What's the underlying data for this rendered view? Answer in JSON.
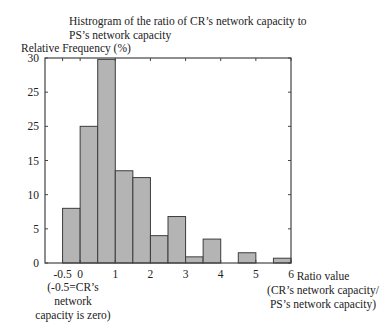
{
  "chart_data": {
    "type": "bar",
    "title": "Histrogram of the ratio of CR’s network capacity to PS’s network capacity",
    "title_lines": [
      "Histrogram of the ratio of CR’s network capacity to",
      "PS’s network capacity"
    ],
    "ylabel": "Relative Frequency (%)",
    "xlabel": "Ratio value (CR’s network capacity/ PS’s network capacity)",
    "xlabel_lines": [
      "Ratio value",
      "(CR’s network capacity/",
      "PS’s network capacity)"
    ],
    "annotation_lines": [
      "(-0.5=CR’s network",
      "capacity is zero)"
    ],
    "xlim": [
      -1,
      6
    ],
    "ylim": [
      0,
      30
    ],
    "xticks": [
      -0.5,
      0,
      1,
      2,
      3,
      4,
      5,
      6
    ],
    "xtick_labels": [
      "-0.5",
      "0",
      "1",
      "2",
      "3",
      "4",
      "5",
      "6"
    ],
    "yticks": [
      0,
      5,
      10,
      15,
      20,
      25,
      30
    ],
    "ytick_labels": [
      "0",
      "5",
      "10",
      "15",
      "25",
      "25",
      "30"
    ],
    "grid": false,
    "bin_width": 0.5,
    "bins": [
      {
        "start": -0.5,
        "end": 0.0,
        "value": 8.0
      },
      {
        "start": 0.0,
        "end": 0.5,
        "value": 20.0
      },
      {
        "start": 0.5,
        "end": 1.0,
        "value": 29.8
      },
      {
        "start": 1.0,
        "end": 1.5,
        "value": 13.5
      },
      {
        "start": 1.5,
        "end": 2.0,
        "value": 12.5
      },
      {
        "start": 2.0,
        "end": 2.5,
        "value": 4.0
      },
      {
        "start": 2.5,
        "end": 3.0,
        "value": 6.8
      },
      {
        "start": 3.0,
        "end": 3.5,
        "value": 0.9
      },
      {
        "start": 3.5,
        "end": 4.0,
        "value": 3.5
      },
      {
        "start": 4.0,
        "end": 4.5,
        "value": 0.0
      },
      {
        "start": 4.5,
        "end": 5.0,
        "value": 1.5
      },
      {
        "start": 5.0,
        "end": 5.5,
        "value": 0.0
      },
      {
        "start": 5.5,
        "end": 6.0,
        "value": 0.7
      }
    ],
    "categories": [
      "-0.5–0",
      "0–0.5",
      "0.5–1",
      "1–1.5",
      "1.5–2",
      "2–2.5",
      "2.5–3",
      "3–3.5",
      "3.5–4",
      "4–4.5",
      "4.5–5",
      "5–5.5",
      "5.5–6"
    ],
    "values": [
      8.0,
      20.0,
      29.8,
      13.5,
      12.5,
      4.0,
      6.8,
      0.9,
      3.5,
      0.0,
      1.5,
      0.0,
      0.7
    ],
    "colors": {
      "bar_fill": "#b4b4b4",
      "bar_edge": "#3c3c3c",
      "axis": "#444444"
    }
  }
}
